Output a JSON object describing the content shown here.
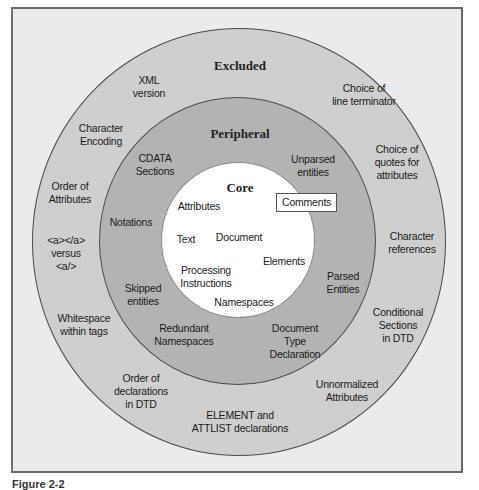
{
  "diagram": {
    "type": "concentric-circles",
    "rings": [
      {
        "name": "Excluded",
        "color": "#cfcfcf"
      },
      {
        "name": "Peripheral",
        "color": "#b3b3b3"
      },
      {
        "name": "Core",
        "color": "#ffffff"
      }
    ],
    "excluded": {
      "title": "Excluded",
      "items": [
        {
          "id": "xml-version",
          "lines": [
            "XML",
            "version"
          ]
        },
        {
          "id": "line-terminator",
          "lines": [
            "Choice of",
            "line terminator"
          ]
        },
        {
          "id": "character-encoding",
          "lines": [
            "Character",
            "Encoding"
          ]
        },
        {
          "id": "quotes-for-attributes",
          "lines": [
            "Choice of",
            "quotes for",
            "attributes"
          ]
        },
        {
          "id": "order-of-attributes",
          "lines": [
            "Order of",
            "Attributes"
          ]
        },
        {
          "id": "character-references",
          "lines": [
            "Character",
            "references"
          ]
        },
        {
          "id": "empty-element-syntax",
          "lines": [
            "<a></a>",
            "versus",
            "<a/>"
          ]
        },
        {
          "id": "whitespace-within-tags",
          "lines": [
            "Whitespace",
            "within tags"
          ]
        },
        {
          "id": "conditional-sections",
          "lines": [
            "Conditional",
            "Sections",
            "in DTD"
          ]
        },
        {
          "id": "order-of-declarations",
          "lines": [
            "Order of",
            "declarations",
            "in DTD"
          ]
        },
        {
          "id": "unnormalized-attributes",
          "lines": [
            "Unnormalized",
            "Attributes"
          ]
        },
        {
          "id": "element-attlist-declarations",
          "lines": [
            "ELEMENT and",
            "ATTLIST declarations"
          ]
        }
      ]
    },
    "peripheral": {
      "title": "Peripheral",
      "items": [
        {
          "id": "cdata-sections",
          "lines": [
            "CDATA",
            "Sections"
          ]
        },
        {
          "id": "unparsed-entities",
          "lines": [
            "Unparsed",
            "entities"
          ]
        },
        {
          "id": "notations",
          "lines": [
            "Notations"
          ]
        },
        {
          "id": "parsed-entities",
          "lines": [
            "Parsed",
            "Entities"
          ]
        },
        {
          "id": "skipped-entities",
          "lines": [
            "Skipped",
            "entities"
          ]
        },
        {
          "id": "redundant-namespaces",
          "lines": [
            "Redundant",
            "Namespaces"
          ]
        },
        {
          "id": "document-type-declaration",
          "lines": [
            "Document",
            "Type",
            "Declaration"
          ]
        }
      ]
    },
    "core": {
      "title": "Core",
      "items": [
        {
          "id": "attributes",
          "lines": [
            "Attributes"
          ]
        },
        {
          "id": "comments",
          "lines": [
            "Comments"
          ],
          "boxed": true
        },
        {
          "id": "text",
          "lines": [
            "Text"
          ]
        },
        {
          "id": "document",
          "lines": [
            "Document"
          ]
        },
        {
          "id": "elements",
          "lines": [
            "Elements"
          ]
        },
        {
          "id": "processing-instructions",
          "lines": [
            "Processing",
            "Instructions"
          ]
        },
        {
          "id": "namespaces",
          "lines": [
            "Namespaces"
          ]
        }
      ]
    }
  },
  "labels": {
    "excluded_title": "Excluded",
    "peripheral_title": "Peripheral",
    "core_title": "Core",
    "xml_version": "XML\nversion",
    "line_terminator": "Choice of\nline terminator",
    "character_encoding": "Character\nEncoding",
    "quotes_for_attributes": "Choice of\nquotes for\nattributes",
    "order_of_attributes": "Order of\nAttributes",
    "character_references": "Character\nreferences",
    "empty_element_syntax": "<a></a>\nversus\n<a/>",
    "whitespace_within_tags": "Whitespace\nwithin tags",
    "conditional_sections": "Conditional\nSections\nin DTD",
    "order_of_declarations": "Order of\ndeclarations\nin DTD",
    "unnormalized_attributes": "Unnormalized\nAttributes",
    "element_attlist": "ELEMENT and\nATTLIST declarations",
    "cdata_sections": "CDATA\nSections",
    "unparsed_entities": "Unparsed\nentities",
    "notations": "Notations",
    "parsed_entities": "Parsed\nEntities",
    "skipped_entities": "Skipped\nentities",
    "redundant_namespaces": "Redundant\nNamespaces",
    "document_type_declaration": "Document\nType\nDeclaration",
    "attributes": "Attributes",
    "comments": "Comments",
    "text": "Text",
    "document": "Document",
    "elements": "Elements",
    "processing_instructions": "Processing\nInstructions",
    "namespaces": "Namespaces"
  },
  "caption": "Figure 2-2"
}
